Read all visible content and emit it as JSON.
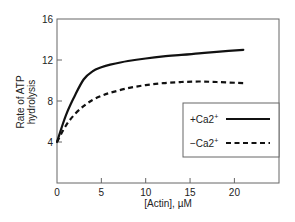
{
  "chart_data": {
    "type": "line",
    "title": "",
    "xlabel": "[Actin], µM",
    "ylabel_lines": [
      "Rate of ATP",
      "hydrolysis"
    ],
    "ylabel": "Rate of ATP hydrolysis",
    "xlim": [
      0,
      24.3
    ],
    "ylim": [
      0,
      16
    ],
    "x_ticks": [
      0,
      5,
      10,
      15,
      20
    ],
    "x_tick_labels": [
      "0",
      "5",
      "10",
      "15",
      "20"
    ],
    "y_ticks": [
      4,
      8,
      12,
      16
    ],
    "y_tick_labels": [
      "4",
      "8",
      "12",
      "16"
    ],
    "grid": false,
    "legend_position": "right, inside plot",
    "series": [
      {
        "name": "+Ca2+",
        "label_main": "+Ca2",
        "label_sup": "+",
        "style": "solid",
        "color": "#111111",
        "x": [
          0,
          1,
          2,
          3,
          4,
          5,
          6,
          8,
          10,
          12,
          14,
          16,
          18,
          21
        ],
        "values": [
          4.0,
          6.6,
          8.5,
          10.1,
          10.9,
          11.3,
          11.55,
          11.9,
          12.15,
          12.35,
          12.5,
          12.65,
          12.8,
          13.0
        ]
      },
      {
        "name": "−Ca2+",
        "label_main": "−Ca2",
        "label_sup": "+",
        "style": "dashed",
        "color": "#111111",
        "x": [
          0,
          1,
          2,
          3,
          4,
          5,
          6,
          8,
          10,
          12,
          14,
          16,
          18,
          21
        ],
        "values": [
          4.0,
          5.6,
          6.7,
          7.5,
          8.1,
          8.5,
          8.8,
          9.25,
          9.55,
          9.75,
          9.85,
          9.9,
          9.85,
          9.75
        ]
      }
    ]
  },
  "colors": {
    "axis": "#555555",
    "line": "#111111",
    "background": "#ffffff"
  }
}
